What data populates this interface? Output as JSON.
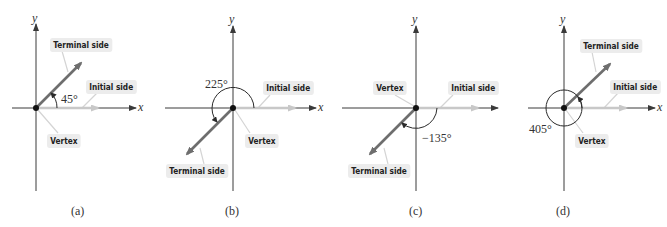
{
  "figure": {
    "panels": [
      {
        "caption": "(a)",
        "angle_label": "45°",
        "angle_deg": 45,
        "labels": {
          "terminal": "Terminal side",
          "initial": "Initial side",
          "vertex": "Vertex"
        },
        "axes": {
          "x": "x",
          "y": "y"
        }
      },
      {
        "caption": "(b)",
        "angle_label": "225°",
        "angle_deg": 225,
        "labels": {
          "terminal": "Terminal side",
          "initial": "Initial side",
          "vertex": "Vertex"
        },
        "axes": {
          "x": "x",
          "y": "y"
        }
      },
      {
        "caption": "(c)",
        "angle_label": "−135°",
        "angle_deg": -135,
        "labels": {
          "terminal": "Terminal side",
          "initial": "Initial side",
          "vertex": "Vertex"
        },
        "axes": {
          "x": "x",
          "y": "y"
        }
      },
      {
        "caption": "(d)",
        "angle_label": "405°",
        "angle_deg": 405,
        "labels": {
          "terminal": "Terminal side",
          "initial": "Initial side",
          "vertex": "Vertex"
        },
        "axes": {
          "x": "x",
          "y": "y"
        }
      }
    ],
    "colors": {
      "terminal_side": "#6e6e6e",
      "initial_side": "#c8c8c8",
      "axis": "#3a3a3a",
      "label_bg": "#ececec"
    }
  }
}
